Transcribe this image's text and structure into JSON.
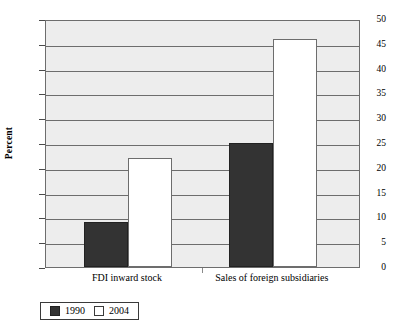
{
  "chart_data": {
    "type": "bar",
    "title": "",
    "xlabel": "",
    "ylabel": "Percent",
    "ylim": [
      0,
      50
    ],
    "ytick_labels": [
      "50",
      "45",
      "40",
      "35",
      "30",
      "25",
      "20",
      "15",
      "10",
      "5",
      "0"
    ],
    "yticks": [
      50,
      45,
      40,
      35,
      30,
      25,
      20,
      15,
      10,
      5,
      0
    ],
    "grid": true,
    "legend_position": "below-left",
    "categories": [
      "FDI inward stock",
      "Sales of foreign subsidiaries"
    ],
    "series": [
      {
        "name": "1990",
        "color": "#333333",
        "values": [
          9,
          25
        ]
      },
      {
        "name": "2004",
        "color": "#ffffff",
        "values": [
          22,
          46
        ]
      }
    ]
  },
  "legend": {
    "entries": [
      {
        "label": "1990",
        "swatch": "dark-filled-square"
      },
      {
        "label": "2004",
        "swatch": "white-outlined-square"
      }
    ]
  }
}
